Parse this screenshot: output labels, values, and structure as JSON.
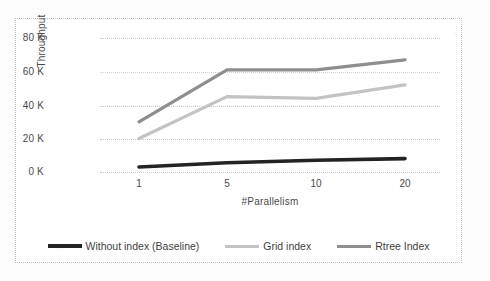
{
  "chart_data": {
    "type": "line",
    "title": "",
    "xlabel": "#Parallelism",
    "ylabel": "Throughput",
    "categories": [
      "1",
      "5",
      "10",
      "20"
    ],
    "x_tick_labels": [
      "1",
      "5",
      "10",
      "20"
    ],
    "y_tick_labels": [
      "80 K",
      "60 K",
      "40 K",
      "20 K",
      "0 K"
    ],
    "y_ticks": [
      80000,
      60000,
      20000,
      40000,
      0
    ],
    "ylim": [
      0,
      80000
    ],
    "grid": true,
    "legend_position": "bottom",
    "series": [
      {
        "name": "Without index (Baseline)",
        "color": "#232323",
        "values": [
          3000,
          5500,
          7000,
          8000
        ]
      },
      {
        "name": "Grid index",
        "color": "#c3c3c3",
        "values": [
          20000,
          45000,
          44000,
          52000
        ]
      },
      {
        "name": "Rtree Index",
        "color": "#8e8e8e",
        "values": [
          30000,
          61000,
          61000,
          67000
        ]
      }
    ]
  },
  "axes": {
    "y_labels": [
      {
        "text": "80 K",
        "value": 80000
      },
      {
        "text": "60 K",
        "value": 60000
      },
      {
        "text": "40 K",
        "value": 40000
      },
      {
        "text": "20 K",
        "value": 20000
      },
      {
        "text": "0 K",
        "value": 0
      }
    ],
    "x_labels": [
      {
        "text": "1",
        "value": 1
      },
      {
        "text": "5",
        "value": 5
      },
      {
        "text": "10",
        "value": 10
      },
      {
        "text": "20",
        "value": 20
      }
    ],
    "x_title": "#Parallelism",
    "y_title": "Throughput"
  },
  "legend": {
    "items": [
      {
        "label": "Without index (Baseline)",
        "color": "#232323"
      },
      {
        "label": "Grid index",
        "color": "#c3c3c3"
      },
      {
        "label": "Rtree Index",
        "color": "#8e8e8e"
      }
    ]
  },
  "colors": {
    "baseline": "#232323",
    "grid_index": "#c3c3c3",
    "rtree_index": "#8e8e8e",
    "gridline": "#c9c9c9",
    "frame": "#c2c2c2",
    "background": "#ffffff"
  }
}
